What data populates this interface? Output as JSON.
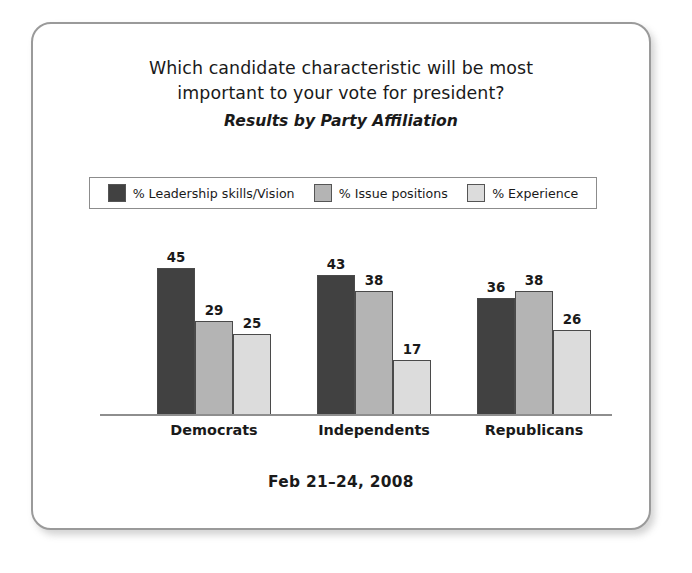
{
  "card": {
    "title_line_1": "Which candidate characteristic will be most",
    "title_line_2": "important to your vote for president?",
    "subtitle": "Results by Party Affiliation",
    "footer_date": "Feb 21–24, 2008"
  },
  "legend": {
    "items": [
      {
        "label": "% Leadership skills/Vision",
        "color": "#414141"
      },
      {
        "label": "% Issue positions",
        "color": "#b4b4b4"
      },
      {
        "label": "% Experience",
        "color": "#dcdcdc"
      }
    ]
  },
  "chart_data": {
    "type": "bar",
    "title": "Which candidate characteristic will be most important to your vote for president?",
    "subtitle": "Results by Party Affiliation",
    "annotation": "Feb 21–24, 2008",
    "categories": [
      "Democrats",
      "Independents",
      "Republicans"
    ],
    "series": [
      {
        "name": "% Leadership skills/Vision",
        "color": "#414141",
        "values": [
          45,
          43,
          36
        ]
      },
      {
        "name": "% Issue positions",
        "color": "#b4b4b4",
        "values": [
          29,
          38,
          38
        ]
      },
      {
        "name": "% Experience",
        "color": "#dcdcdc",
        "values": [
          25,
          17,
          26
        ]
      }
    ],
    "xlabel": "",
    "ylabel": "",
    "ylim": [
      0,
      50
    ],
    "grid": false,
    "legend_position": "top",
    "data_labels": true
  }
}
